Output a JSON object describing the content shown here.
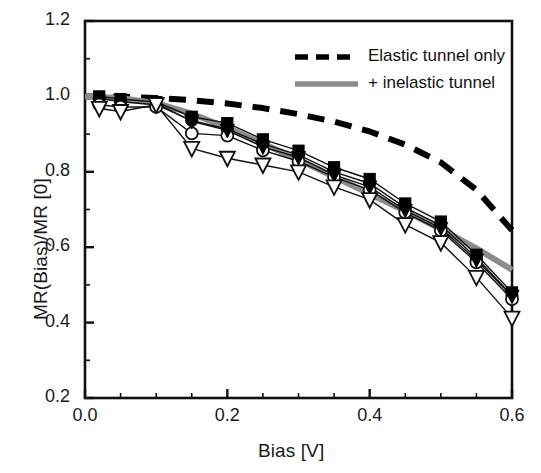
{
  "chart_data": {
    "type": "line",
    "title": "",
    "xlabel": "Bias [V]",
    "ylabel": "MR(Bias)/MR [0]",
    "xlim": [
      0.0,
      0.6
    ],
    "ylim": [
      0.2,
      1.2
    ],
    "xticks": [
      "0.0",
      "0.2",
      "0.4",
      "0.6"
    ],
    "xtick_values": [
      0.0,
      0.2,
      0.4,
      0.6
    ],
    "xminor_step": 0.05,
    "yticks": [
      "0.2",
      "0.4",
      "0.6",
      "0.8",
      "1.0",
      "1.2"
    ],
    "ytick_values": [
      0.2,
      0.4,
      0.6,
      0.8,
      1.0,
      1.2
    ],
    "yminor_step": 0.1,
    "grid": false,
    "legend_position": "top-right",
    "legend": [
      {
        "label": "Elastic tunnel only",
        "style": "dashed",
        "color": "#000000",
        "width": 5
      },
      {
        "label": "+ inelastic tunnel",
        "style": "solid",
        "color": "#8c8c8c",
        "width": 5
      }
    ],
    "series": [
      {
        "name": "Elastic tunnel only",
        "type": "model-curve",
        "style": "dashed",
        "color": "#000000",
        "x": [
          0.0,
          0.05,
          0.1,
          0.15,
          0.2,
          0.25,
          0.3,
          0.35,
          0.4,
          0.45,
          0.5,
          0.55,
          0.6
        ],
        "y": [
          1.0,
          0.999,
          0.996,
          0.99,
          0.981,
          0.969,
          0.953,
          0.933,
          0.907,
          0.872,
          0.825,
          0.752,
          0.645
        ]
      },
      {
        "name": "+ inelastic tunnel",
        "type": "model-curve",
        "style": "solid",
        "color": "#8c8c8c",
        "x": [
          0.0,
          0.05,
          0.1,
          0.15,
          0.2,
          0.25,
          0.3,
          0.35,
          0.4,
          0.45,
          0.5,
          0.55,
          0.6
        ],
        "y": [
          1.0,
          0.996,
          0.982,
          0.954,
          0.917,
          0.875,
          0.832,
          0.787,
          0.742,
          0.696,
          0.648,
          0.597,
          0.54
        ]
      },
      {
        "name": "filled-squares",
        "type": "data",
        "marker": "filled-square",
        "color": "#000000",
        "x": [
          0.02,
          0.05,
          0.1,
          0.15,
          0.2,
          0.25,
          0.3,
          0.35,
          0.4,
          0.45,
          0.5,
          0.55,
          0.6
        ],
        "y": [
          1.0,
          0.993,
          0.985,
          0.946,
          0.929,
          0.886,
          0.856,
          0.812,
          0.781,
          0.716,
          0.668,
          0.58,
          0.48
        ]
      },
      {
        "name": "filled-circles",
        "type": "data",
        "marker": "filled-circle",
        "color": "#000000",
        "x": [
          0.02,
          0.05,
          0.1,
          0.15,
          0.2,
          0.25,
          0.3,
          0.35,
          0.4,
          0.45,
          0.5,
          0.55,
          0.6
        ],
        "y": [
          0.995,
          0.986,
          0.978,
          0.936,
          0.913,
          0.874,
          0.845,
          0.8,
          0.769,
          0.705,
          0.658,
          0.572,
          0.472
        ]
      },
      {
        "name": "open-circles",
        "type": "data",
        "marker": "open-circle",
        "color": "#000000",
        "x": [
          0.02,
          0.05,
          0.1,
          0.15,
          0.2,
          0.25,
          0.3,
          0.35,
          0.4,
          0.45,
          0.5,
          0.55,
          0.6
        ],
        "y": [
          0.978,
          0.972,
          0.972,
          0.902,
          0.896,
          0.857,
          0.828,
          0.786,
          0.752,
          0.692,
          0.644,
          0.56,
          0.462
        ]
      },
      {
        "name": "filled-triangles-down",
        "type": "data",
        "marker": "filled-triangle-down",
        "color": "#000000",
        "x": [
          0.1,
          0.15,
          0.2,
          0.25,
          0.3,
          0.35,
          0.4,
          0.45,
          0.5,
          0.55,
          0.6
        ],
        "y": [
          0.982,
          0.934,
          0.91,
          0.866,
          0.838,
          0.792,
          0.76,
          0.698,
          0.65,
          0.566,
          0.47
        ]
      },
      {
        "name": "open-triangles-down",
        "type": "data",
        "marker": "open-triangle-down",
        "color": "#000000",
        "x": [
          0.02,
          0.05,
          0.1,
          0.15,
          0.2,
          0.25,
          0.3,
          0.35,
          0.4,
          0.45,
          0.5,
          0.55,
          0.6
        ],
        "y": [
          0.968,
          0.96,
          0.978,
          0.862,
          0.836,
          0.818,
          0.8,
          0.76,
          0.726,
          0.66,
          0.612,
          0.52,
          0.412
        ]
      }
    ]
  }
}
